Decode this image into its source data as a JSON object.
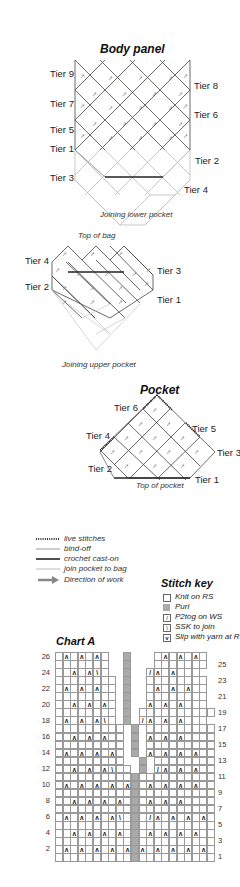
{
  "body_panel": {
    "title": "Body panel",
    "left_tiers": [
      "Tier 9",
      "Tier 7",
      "Tier 5",
      "Tier 1",
      "Tier 3"
    ],
    "right_tiers": [
      "Tier 8",
      "Tier 6",
      "Tier 2",
      "Tier 4"
    ],
    "caption": "Joining lower pocket"
  },
  "top_section": {
    "top_caption": "Top of bag",
    "left_tiers": [
      "Tier 4",
      "Tier 2"
    ],
    "right_tiers": [
      "Tier 3",
      "Tier 1"
    ],
    "caption": "Joining upper pocket"
  },
  "pocket": {
    "title": "Pocket",
    "tiers": {
      "t6": "Tier 6",
      "t5": "Tier 5",
      "t4": "Tier 4",
      "t3": "Tier 3",
      "t2": "Tier 2",
      "t1": "Tier 1"
    },
    "caption": "Top of pocket"
  },
  "legend": {
    "items": [
      {
        "style": "live",
        "label": "live stitches"
      },
      {
        "style": "bindoff",
        "label": "bind-off"
      },
      {
        "style": "crochet",
        "label": "crochet cast-on"
      },
      {
        "style": "join",
        "label": "join pocket to bag"
      },
      {
        "style": "arrow",
        "label": "Direction of work"
      }
    ]
  },
  "stitch_key": {
    "title": "Stitch key",
    "items": [
      {
        "symbol": "empty",
        "label": "Knit on RS"
      },
      {
        "symbol": "purl",
        "label": "Purl"
      },
      {
        "symbol": "p2tog",
        "label": "P2tog on WS"
      },
      {
        "symbol": "ssk",
        "label": "SSK to join"
      },
      {
        "symbol": "slip",
        "label": "Slip with yarn at RS"
      }
    ]
  },
  "chart_data": {
    "type": "table",
    "title": "Chart A",
    "left_row_labels": [
      "26",
      "24",
      "22",
      "20",
      "18",
      "16",
      "14",
      "12",
      "10",
      "8",
      "6",
      "4",
      "2"
    ],
    "right_row_labels": [
      "25",
      "23",
      "21",
      "19",
      "17",
      "15",
      "13",
      "11",
      "9",
      "7",
      "5",
      "3",
      "1"
    ],
    "columns": 21,
    "rows": 26,
    "purl_column": 10,
    "symbols": {
      "V": "slip with yarn at RS",
      "/": "P2tog on WS",
      "\\": "SSK to join",
      "P": "Purl",
      ".": "Knit on RS",
      " ": "no stitch"
    },
    "grid_top_to_bottom": [
      ".V.V.V.  P   .V.V.V.",
      ".......  P   .......",
      "..V.V\\.  P  /V.V...",
      "........ P  ........",
      ".V.V.V.. P  .V.V.V..",
      "........ P  ........",
      "..V.V.V. P  V.V.V...",
      "........ P ..........",
      ".V.V.V\\. P /V.V.V...",
      "......... P .........",
      "..V.V.V.. P V.V.V....",
      "......... P .........",
      ".V.V.V.V. P V.V.V.V..",
      ".........  P .........",
      "..V.V.V\\.. P /V.V.V...",
      "..........P..........",
      ".V.V.V.V.VP.V.V.V.V..",
      "..........P..........",
      "..V.V.V.V.P.V.V.V....",
      "..........P..........",
      ".V.V.V.V\\.P./V.V.V.V.",
      "..........P..........",
      "..V.V.V.V.P.V.V.V.V..",
      "..........P..........",
      ".V.V.V.V.VPV.V.V.V.V.",
      "..........P.........."
    ]
  }
}
